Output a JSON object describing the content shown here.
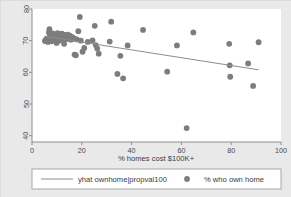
{
  "chart_data": {
    "type": "scatter",
    "title": "",
    "subtitle": "",
    "xlabel": "% homes cost $100K+",
    "ylabel": "",
    "xlim": [
      0,
      100
    ],
    "ylim": [
      38,
      80
    ],
    "xticks": [
      "0",
      "20",
      "40",
      "60",
      "80",
      "100"
    ],
    "xtick_values": [
      0,
      20,
      40,
      60,
      80,
      100
    ],
    "yticks": [
      "40",
      "50",
      "60",
      "70",
      "80"
    ],
    "ytick_values": [
      40,
      50,
      60,
      70,
      80
    ],
    "grid": false,
    "legend_position": "bottom",
    "marker_color": "#7d7d7d",
    "line_color": "#8c8c8c",
    "plot_background": "#ffffff",
    "figure_background": "#e9e9e9",
    "series": [
      {
        "name": "% who own home",
        "type": "scatter",
        "marker": "circle",
        "color": "#7d7d7d",
        "points": [
          [
            5.2,
            69.9
          ],
          [
            5.6,
            70.3
          ],
          [
            6.0,
            70.6
          ],
          [
            6.4,
            69.6
          ],
          [
            6.8,
            72.6
          ],
          [
            7.0,
            73.6
          ],
          [
            7.2,
            71.4
          ],
          [
            7.6,
            70.8
          ],
          [
            7.9,
            69.8
          ],
          [
            8.2,
            72.3
          ],
          [
            8.5,
            71.2
          ],
          [
            8.8,
            70.4
          ],
          [
            9.1,
            72.0
          ],
          [
            9.4,
            71.6
          ],
          [
            9.6,
            70.2
          ],
          [
            9.9,
            69.3
          ],
          [
            10.2,
            72.4
          ],
          [
            10.5,
            71.0
          ],
          [
            10.8,
            70.0
          ],
          [
            11.1,
            72.1
          ],
          [
            11.4,
            71.3
          ],
          [
            11.7,
            70.7
          ],
          [
            12.0,
            72.2
          ],
          [
            12.3,
            71.5
          ],
          [
            12.6,
            70.1
          ],
          [
            12.9,
            69.0
          ],
          [
            13.2,
            71.8
          ],
          [
            13.6,
            71.1
          ],
          [
            14.0,
            70.5
          ],
          [
            14.4,
            71.9
          ],
          [
            14.8,
            70.9
          ],
          [
            15.2,
            71.6
          ],
          [
            15.6,
            70.3
          ],
          [
            16.0,
            71.2
          ],
          [
            16.4,
            70.6
          ],
          [
            16.8,
            70.8
          ],
          [
            17.1,
            65.6
          ],
          [
            17.6,
            65.4
          ],
          [
            18.0,
            70.4
          ],
          [
            18.6,
            73.0
          ],
          [
            19.2,
            77.5
          ],
          [
            19.6,
            70.0
          ],
          [
            20.3,
            66.5
          ],
          [
            21.0,
            67.7
          ],
          [
            22.4,
            69.6
          ],
          [
            24.3,
            70.1
          ],
          [
            25.2,
            74.7
          ],
          [
            25.6,
            68.6
          ],
          [
            26.2,
            67.5
          ],
          [
            26.8,
            65.9
          ],
          [
            31.2,
            69.7
          ],
          [
            31.8,
            76.0
          ],
          [
            34.3,
            59.5
          ],
          [
            35.5,
            65.2
          ],
          [
            36.6,
            58.1
          ],
          [
            38.4,
            68.5
          ],
          [
            44.6,
            73.4
          ],
          [
            54.3,
            60.2
          ],
          [
            58.2,
            68.5
          ],
          [
            62.1,
            42.4
          ],
          [
            64.8,
            72.6
          ],
          [
            79.2,
            69.0
          ],
          [
            79.4,
            62.2
          ],
          [
            79.6,
            58.6
          ],
          [
            86.8,
            62.8
          ],
          [
            88.8,
            55.7
          ],
          [
            91.0,
            69.5
          ]
        ]
      },
      {
        "name": "yhat ownhome|propval100",
        "type": "line",
        "color": "#8c8c8c",
        "endpoints": [
          [
            5.0,
            71.4
          ],
          [
            91.0,
            60.8
          ]
        ]
      }
    ],
    "legend": [
      {
        "label": "yhat ownhome|propval100",
        "swatch": "line",
        "color": "#8c8c8c"
      },
      {
        "label": "% who own home",
        "swatch": "circle",
        "color": "#7d7d7d"
      }
    ]
  }
}
